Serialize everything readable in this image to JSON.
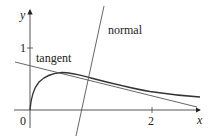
{
  "diagram": {
    "axes": {
      "x_label": "x",
      "y_label": "y",
      "origin_label": "0",
      "x_tick_label": "2",
      "y_tick_label": "1"
    },
    "labels": {
      "tangent": "tangent",
      "normal": "normal"
    },
    "colors": {
      "axis": "#333333",
      "curve": "#333333",
      "lines": "#555555",
      "text": "#222222"
    }
  }
}
